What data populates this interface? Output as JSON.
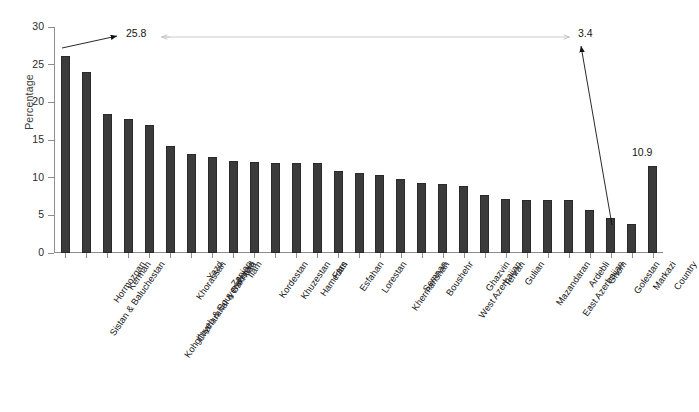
{
  "chart_data": {
    "type": "bar",
    "title": "",
    "subtitle": "",
    "xlabel": "",
    "ylabel": "Percentage",
    "ylim": [
      0,
      30
    ],
    "ytick_labels": [
      "0",
      "5",
      "10",
      "15",
      "20",
      "25",
      "30"
    ],
    "yticks": [
      0,
      5,
      10,
      15,
      20,
      25,
      30
    ],
    "grid": false,
    "legend": null,
    "bar_color": "#3b3b3b",
    "axis_color": "#8d8d8d",
    "categories": [
      "Sistan & Baluchestan",
      "Hormozgan",
      "Kerman",
      "Kohgiluyeh & Bouyerahmad",
      "Chaharahal & Bakhtiari",
      "Khorassan",
      "Yazd",
      "Zanjan",
      "Ilam",
      "Kordestan",
      "Khuzestan",
      "Hamedan",
      "Fars",
      "Esfahan",
      "Lorestan",
      "Khermanshah",
      "Semnan",
      "Boushehr",
      "West Azerbaijan",
      "Ghazvin",
      "Tehran",
      "Gulian",
      "Mazandaran",
      "East Azerbaijan",
      "Ardebli",
      "Ghom",
      "Golestan",
      "Markazi",
      "Country"
    ],
    "values": [
      26.2,
      24.0,
      18.5,
      17.8,
      17.0,
      14.2,
      13.2,
      12.7,
      12.2,
      12.1,
      12.0,
      12.0,
      12.0,
      10.9,
      10.6,
      10.3,
      9.8,
      9.3,
      9.2,
      8.9,
      7.7,
      7.2,
      7.0,
      7.0,
      7.0,
      5.7,
      4.7,
      3.9,
      11.6
    ],
    "annotations": [
      {
        "name": "max-value-annotation",
        "label": "25.8",
        "points_to_category": "Sistan & Baluchestan",
        "description": "arrow from label to the tallest bar"
      },
      {
        "name": "min-value-annotation",
        "label": "3.4",
        "points_to_category": "Markazi",
        "description": "arrow from label down to the shortest province bar"
      },
      {
        "name": "country-value-annotation",
        "label": "10.9",
        "points_to_category": "Country",
        "description": "value label above the last (Country) bar"
      },
      {
        "name": "range-connector",
        "label": "",
        "description": "horizontal double-headed connector between the 25.8 and 3.4 labels"
      }
    ]
  },
  "axis": {
    "y_title": "Percentage"
  }
}
